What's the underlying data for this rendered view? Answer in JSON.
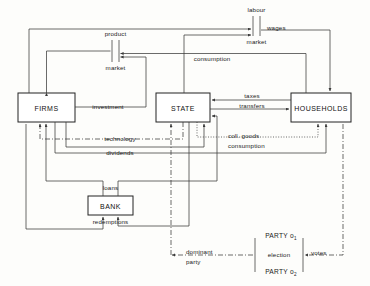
{
  "diagram": {
    "background_color": "#fdfdfb",
    "line_color": "#3a3a3a",
    "text_color": "#1a1a1a",
    "boxes": [
      {
        "id": "firms",
        "label": "FIRMS"
      },
      {
        "id": "state",
        "label": "STATE"
      },
      {
        "id": "households",
        "label": "HOUSEHOLDS"
      },
      {
        "id": "bank",
        "label": "BANK"
      }
    ],
    "markets": [
      {
        "id": "product-market",
        "line1": "product",
        "line2": "market"
      },
      {
        "id": "labour-market",
        "line1": "labour",
        "line2": "market"
      }
    ],
    "flow_labels": [
      {
        "id": "wages",
        "text": "wages",
        "style": "solid"
      },
      {
        "id": "consumption",
        "text": "consumption",
        "style": "solid"
      },
      {
        "id": "investment",
        "text": "investment",
        "style": "solid"
      },
      {
        "id": "taxes",
        "text": "taxes",
        "style": "solid"
      },
      {
        "id": "transfers",
        "text": "transfers",
        "style": "solid"
      },
      {
        "id": "technology",
        "text": "technology",
        "style": "dash-dot"
      },
      {
        "id": "dividends",
        "text": "dividends",
        "style": "solid"
      },
      {
        "id": "coll-goods",
        "text": "coll. goods",
        "style": "dotted"
      },
      {
        "id": "coll-goods-2",
        "text": "consumption",
        "style": "dotted"
      },
      {
        "id": "loans",
        "text": "loans",
        "style": "solid"
      },
      {
        "id": "redemptions",
        "text": "redemptions",
        "style": "solid"
      },
      {
        "id": "dominant",
        "text": "dominant",
        "style": "dash-dot"
      },
      {
        "id": "dominant-2",
        "text": "party",
        "style": "dash-dot"
      },
      {
        "id": "election",
        "text": "election",
        "style": "dash-dot"
      },
      {
        "id": "votes",
        "text": "votes",
        "style": "dash-dot"
      }
    ],
    "parties": [
      {
        "id": "party-o1",
        "name": "PARTY o",
        "subscript": "1"
      },
      {
        "id": "party-o2",
        "name": "PARTY o",
        "subscript": "2"
      }
    ]
  }
}
